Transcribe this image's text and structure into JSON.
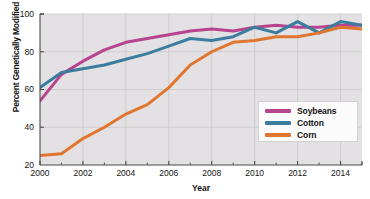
{
  "chart_data": {
    "type": "line",
    "title": "",
    "xlabel": "Year",
    "ylabel": "Percent Genetically Modified",
    "xlim": [
      2000,
      2015
    ],
    "ylim": [
      20,
      100
    ],
    "grid": true,
    "legend_position": "center-right",
    "x": [
      2000,
      2001,
      2002,
      2003,
      2004,
      2005,
      2006,
      2007,
      2008,
      2009,
      2010,
      2011,
      2012,
      2013,
      2014,
      2015
    ],
    "xticks": [
      "2000",
      "2002",
      "2004",
      "2006",
      "2008",
      "2010",
      "2012",
      "2014"
    ],
    "yticks": [
      "20",
      "40",
      "60",
      "80",
      "100"
    ],
    "series": [
      {
        "name": "Soybeans",
        "color": "#b8438f",
        "values": [
          54,
          68,
          75,
          81,
          85,
          87,
          89,
          91,
          92,
          91,
          93,
          94,
          93,
          93,
          94,
          94
        ]
      },
      {
        "name": "Cotton",
        "color": "#3b7d9e",
        "values": [
          61,
          69,
          71,
          73,
          76,
          79,
          83,
          87,
          86,
          88,
          93,
          90,
          96,
          90,
          96,
          94
        ]
      },
      {
        "name": "Corn",
        "color": "#e0762f",
        "values": [
          25,
          26,
          34,
          40,
          47,
          52,
          61,
          73,
          80,
          85,
          86,
          88,
          88,
          90,
          93,
          92
        ]
      }
    ]
  },
  "axis": {
    "y_title": "Percent Genetically Modified",
    "x_title": "Year"
  },
  "legend": {
    "items": [
      {
        "label": "Soybeans",
        "color": "#b8438f"
      },
      {
        "label": "Cotton",
        "color": "#3b7d9e"
      },
      {
        "label": "Corn",
        "color": "#e0762f"
      }
    ]
  },
  "colors": {
    "plot_background": "#e3e1e3",
    "gridline": "#c9c7c9",
    "axis": "#4a4a4a",
    "text": "#131313"
  }
}
